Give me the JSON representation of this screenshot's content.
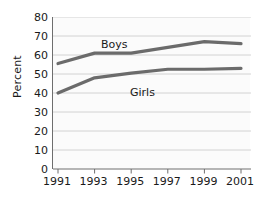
{
  "chart_data": {
    "type": "line",
    "title": "",
    "subtitle": "",
    "xlabel": "",
    "ylabel": "Percent",
    "x": [
      "1991",
      "1993",
      "1995",
      "1997",
      "1999",
      "2001"
    ],
    "categories": [
      "1991",
      "1993",
      "1995",
      "1997",
      "1999",
      "2001"
    ],
    "series": [
      {
        "name": "Boys",
        "values": [
          55.5,
          61,
          61,
          64,
          67,
          66
        ],
        "color": "#6b6b6b"
      },
      {
        "name": "Girls",
        "values": [
          40,
          48,
          50.5,
          52.5,
          52.5,
          53
        ],
        "color": "#6b6b6b"
      }
    ],
    "ylim": [
      0,
      80
    ],
    "yticks": [
      "0",
      "10",
      "20",
      "30",
      "40",
      "50",
      "60",
      "70",
      "80"
    ],
    "xticks": [
      "1991",
      "1993",
      "1995",
      "1997",
      "1999",
      "2001"
    ],
    "grid": "horizontal",
    "legend": "inline-labels",
    "legend_position": "inline",
    "annotations": [
      {
        "text": "Boys",
        "series": "Boys"
      },
      {
        "text": "Girls",
        "series": "Girls"
      }
    ]
  },
  "axes": {
    "y_title": "Percent",
    "y_tick_labels": [
      "80",
      "70",
      "60",
      "50",
      "40",
      "30",
      "20",
      "10",
      "0"
    ],
    "x_tick_labels": [
      "1991",
      "1993",
      "1995",
      "1997",
      "1999",
      "2001"
    ]
  },
  "colors": {
    "line": "#6b6b6b",
    "grid": "#c9c9c9",
    "axis": "#6e6e6e",
    "text": "#1a1a1a",
    "plot_background": "#fbfbfb",
    "page_background": "#ffffff"
  }
}
